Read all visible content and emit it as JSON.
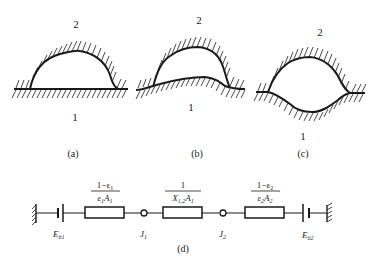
{
  "figure": {
    "panels": [
      {
        "id": "a",
        "caption": "(a)",
        "surface_top_label": "2",
        "surface_bottom_label": "1",
        "description": "convex cavity over flat surface"
      },
      {
        "id": "b",
        "caption": "(b)",
        "surface_top_label": "2",
        "surface_bottom_label": "1",
        "description": "cavity over convex bump surface"
      },
      {
        "id": "c",
        "caption": "(c)",
        "surface_top_label": "2",
        "surface_bottom_label": "1",
        "description": "enclosure with concave lower surface"
      }
    ],
    "network": {
      "caption": "(d)",
      "source_left": {
        "label": "E",
        "sub": "b1"
      },
      "source_right": {
        "label": "E",
        "sub": "b2"
      },
      "node_left": {
        "label": "J",
        "sub": "1"
      },
      "node_right": {
        "label": "J",
        "sub": "2"
      },
      "resistors": [
        {
          "num": "1−ε",
          "num_sub": "1",
          "den": "ε",
          "den_sub": "1",
          "den2": "A",
          "den2_sub": "1"
        },
        {
          "num": "1",
          "num_sub": "",
          "den": "X",
          "den_sub": "1,2",
          "den2": "A",
          "den2_sub": "1"
        },
        {
          "num": "1−ε",
          "num_sub": "2",
          "den": "ε",
          "den_sub": "2",
          "den2": "A",
          "den2_sub": "2"
        }
      ]
    }
  }
}
